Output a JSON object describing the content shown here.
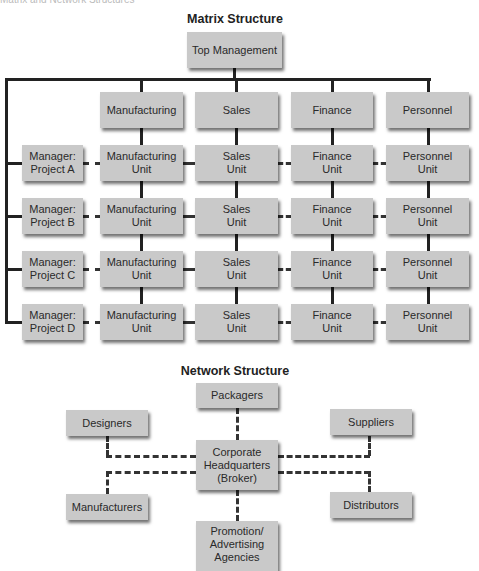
{
  "header": {
    "cut_text": "Matrix and Network Structures"
  },
  "matrix": {
    "title": "Matrix Structure",
    "top": "Top Management",
    "departments": [
      "Manufacturing",
      "Sales",
      "Finance",
      "Personnel"
    ],
    "rows": [
      {
        "manager": "Manager:\nProject A",
        "units": [
          "Manufacturing\nUnit",
          "Sales\nUnit",
          "Finance\nUnit",
          "Personnel\nUnit"
        ]
      },
      {
        "manager": "Manager:\nProject B",
        "units": [
          "Manufacturing\nUnit",
          "Sales\nUnit",
          "Finance\nUnit",
          "Personnel\nUnit"
        ]
      },
      {
        "manager": "Manager:\nProject C",
        "units": [
          "Manufacturing\nUnit",
          "Sales\nUnit",
          "Finance\nUnit",
          "Personnel\nUnit"
        ]
      },
      {
        "manager": "Manager:\nProject D",
        "units": [
          "Manufacturing\nUnit",
          "Sales\nUnit",
          "Finance\nUnit",
          "Personnel\nUnit"
        ]
      }
    ]
  },
  "network": {
    "title": "Network Structure",
    "hub": "Corporate\nHeadquarters\n(Broker)",
    "nodes": {
      "packagers": "Packagers",
      "designers": "Designers",
      "suppliers": "Suppliers",
      "manufacturers": "Manufacturers",
      "distributors": "Distributors",
      "promotion": "Promotion/\nAdvertising\nAgencies"
    }
  }
}
